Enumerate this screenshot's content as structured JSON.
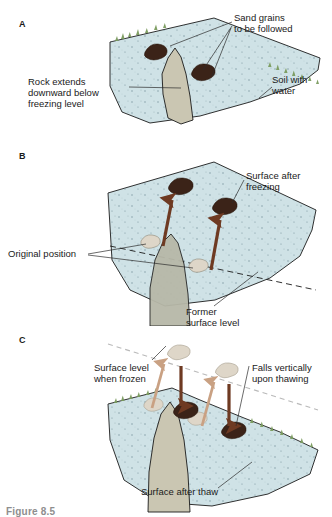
{
  "figure": {
    "caption": "Figure 8.5",
    "panels": [
      {
        "letter": "A",
        "labels": {
          "sand_grains": "Sand grains\nto be followed",
          "rock_extends": "Rock extends\ndownward below\nfreezing level",
          "soil_with_water": "Soil with\nwater"
        }
      },
      {
        "letter": "B",
        "labels": {
          "surface_after_freezing": "Surface after\nfreezing",
          "original_position": "Original position",
          "former_surface_level": "Former\nsurface level"
        }
      },
      {
        "letter": "C",
        "labels": {
          "surface_level_when_frozen": "Surface level\nwhen frozen",
          "falls_vertically": "Falls vertically\nupon thawing",
          "surface_after_thaw": "Surface after thaw"
        }
      }
    ]
  },
  "colors": {
    "soil": "#cfe2e6",
    "soil_speckle": "#6d8c95",
    "rock": "#cac6b2",
    "grain_dark": "#3b2318",
    "grain_light": "#ded6c8",
    "grass": "#7a9b5e",
    "arrow_dark": "#6e3a22",
    "arrow_light": "#c9a183",
    "leader": "#2b2b2b",
    "outline": "#1a1a1a",
    "dashed": "#1a1a1a",
    "caption": "#8e8e8e"
  },
  "icon_names": {
    "sand_grain": "sand-grain-icon",
    "rock": "bedrock-icon",
    "arrow_up": "heave-arrow-up-icon",
    "arrow_down": "fall-arrow-down-icon",
    "grass_tuft": "grass-tuft-icon"
  }
}
